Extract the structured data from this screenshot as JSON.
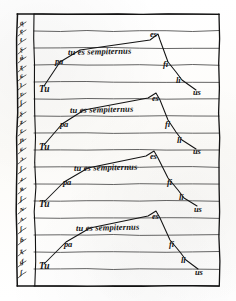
{
  "page": {
    "kind": "manuscript-diagram",
    "width": 236,
    "height": 301,
    "background_color": "#fdfdfb",
    "ink_color": "#131313",
    "rule_color": "#3a3a3a"
  },
  "frame": {
    "left": 17,
    "top": 14,
    "right": 219,
    "bottom": 286,
    "column_divider_x": 34
  },
  "staff": {
    "line_count": 17,
    "first_line_y": 14,
    "spacing": 17,
    "left_x": 34,
    "right_x": 219
  },
  "margin_column": {
    "label": "marginal gloss column",
    "marks": [
      {
        "text": "ą",
        "x": 20,
        "y": 20
      },
      {
        "text": "ę",
        "x": 20,
        "y": 28
      },
      {
        "text": "ŧ",
        "x": 20,
        "y": 37
      },
      {
        "text": "ʂ",
        "x": 20,
        "y": 46
      },
      {
        "text": "ǿ",
        "x": 20,
        "y": 55
      },
      {
        "text": "ʐ",
        "x": 20,
        "y": 64
      },
      {
        "text": "ɕ",
        "x": 20,
        "y": 73
      },
      {
        "text": "ʇ",
        "x": 20,
        "y": 82
      },
      {
        "text": "ʋ",
        "x": 20,
        "y": 91
      },
      {
        "text": "ʃ",
        "x": 20,
        "y": 100
      },
      {
        "text": "ʂ",
        "x": 20,
        "y": 110
      },
      {
        "text": "ʑ",
        "x": 20,
        "y": 119
      },
      {
        "text": "ɛ",
        "x": 20,
        "y": 128
      },
      {
        "text": "ɲ",
        "x": 20,
        "y": 137
      },
      {
        "text": "ɕ",
        "x": 20,
        "y": 146
      },
      {
        "text": "ɔ",
        "x": 20,
        "y": 156
      },
      {
        "text": "ʃ",
        "x": 20,
        "y": 166
      },
      {
        "text": "ɹ",
        "x": 20,
        "y": 176
      },
      {
        "text": "ʀ",
        "x": 20,
        "y": 186
      },
      {
        "text": "ʄ",
        "x": 20,
        "y": 196
      },
      {
        "text": "ɴ",
        "x": 20,
        "y": 206
      },
      {
        "text": "ʌ",
        "x": 20,
        "y": 216
      },
      {
        "text": "ʃ",
        "x": 20,
        "y": 226
      },
      {
        "text": "ɓ",
        "x": 20,
        "y": 237
      },
      {
        "text": "ʐ",
        "x": 20,
        "y": 248
      },
      {
        "text": "ɠ",
        "x": 20,
        "y": 259
      },
      {
        "text": "ʃ",
        "x": 20,
        "y": 270
      }
    ]
  },
  "systems": [
    {
      "id": "system-1",
      "phrase": "tu es sempiternus",
      "phrase_x": 68,
      "phrase_y": 48,
      "start_syllable": {
        "text": "Tu",
        "x": 39,
        "y": 85
      },
      "rise_syllable": {
        "text": "pa",
        "x": 55,
        "y": 57
      },
      "apex_syllable": {
        "text": "es",
        "x": 150,
        "y": 30
      },
      "fall_syllables": [
        {
          "text": "fi",
          "x": 163,
          "y": 60
        },
        {
          "text": "li",
          "x": 176,
          "y": 76
        },
        {
          "text": "us",
          "x": 193,
          "y": 88
        }
      ],
      "path": [
        [
          44,
          86
        ],
        [
          60,
          62
        ],
        [
          80,
          50
        ],
        [
          150,
          40
        ],
        [
          158,
          34
        ],
        [
          160,
          40
        ],
        [
          168,
          62
        ],
        [
          176,
          72
        ],
        [
          182,
          80
        ],
        [
          196,
          90
        ]
      ]
    },
    {
      "id": "system-2",
      "phrase": "tu es sempiternus",
      "phrase_x": 70,
      "phrase_y": 106,
      "start_syllable": {
        "text": "Tu",
        "x": 39,
        "y": 143
      },
      "rise_syllable": {
        "text": "pa",
        "x": 60,
        "y": 120
      },
      "apex_syllable": {
        "text": "es",
        "x": 152,
        "y": 94
      },
      "fall_syllables": [
        {
          "text": "fi",
          "x": 165,
          "y": 120
        },
        {
          "text": "li",
          "x": 177,
          "y": 136
        },
        {
          "text": "us",
          "x": 193,
          "y": 147
        }
      ],
      "path": [
        [
          44,
          145
        ],
        [
          62,
          124
        ],
        [
          84,
          110
        ],
        [
          148,
          98
        ],
        [
          156,
          93
        ],
        [
          160,
          100
        ],
        [
          168,
          120
        ],
        [
          176,
          132
        ],
        [
          182,
          140
        ],
        [
          196,
          149
        ]
      ]
    },
    {
      "id": "system-3",
      "phrase": "tu es sempiternus",
      "phrase_x": 74,
      "phrase_y": 164,
      "start_syllable": {
        "text": "Tu",
        "x": 39,
        "y": 200
      },
      "rise_syllable": {
        "text": "pa",
        "x": 63,
        "y": 178
      },
      "apex_syllable": {
        "text": "es",
        "x": 150,
        "y": 152
      },
      "fall_syllables": [
        {
          "text": "fi",
          "x": 167,
          "y": 178
        },
        {
          "text": "li",
          "x": 179,
          "y": 193
        },
        {
          "text": "us",
          "x": 194,
          "y": 205
        }
      ],
      "path": [
        [
          44,
          202
        ],
        [
          64,
          182
        ],
        [
          88,
          168
        ],
        [
          146,
          156
        ],
        [
          154,
          151
        ],
        [
          158,
          158
        ],
        [
          168,
          178
        ],
        [
          178,
          190
        ],
        [
          184,
          198
        ],
        [
          197,
          206
        ]
      ]
    },
    {
      "id": "system-4",
      "phrase": "tu es sempiternus",
      "phrase_x": 76,
      "phrase_y": 224,
      "start_syllable": {
        "text": "Tu",
        "x": 39,
        "y": 262
      },
      "rise_syllable": {
        "text": "pa",
        "x": 64,
        "y": 240
      },
      "apex_syllable": {
        "text": "es",
        "x": 152,
        "y": 212
      },
      "fall_syllables": [
        {
          "text": "fi",
          "x": 169,
          "y": 240
        },
        {
          "text": "li",
          "x": 181,
          "y": 256
        },
        {
          "text": "us",
          "x": 195,
          "y": 268
        }
      ],
      "path": [
        [
          44,
          264
        ],
        [
          66,
          242
        ],
        [
          90,
          228
        ],
        [
          148,
          216
        ],
        [
          156,
          211
        ],
        [
          160,
          218
        ],
        [
          170,
          240
        ],
        [
          180,
          252
        ],
        [
          186,
          260
        ],
        [
          198,
          269
        ]
      ]
    }
  ]
}
